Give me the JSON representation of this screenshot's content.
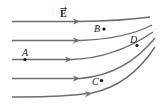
{
  "figure": {
    "field_label": "E",
    "field_symbol": "vector-arrow",
    "line_color": "#6d6d6d",
    "field_line_count": 5,
    "points": [
      {
        "label": "A",
        "on_line": 3
      },
      {
        "label": "B",
        "on_line": null
      },
      {
        "label": "C",
        "on_line": null
      },
      {
        "label": "D",
        "on_line": 3
      }
    ]
  }
}
